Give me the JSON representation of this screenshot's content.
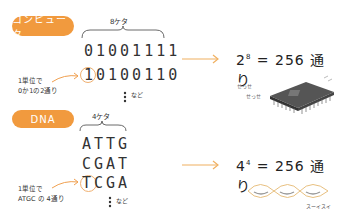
{
  "computer": {
    "tag": "コンピュータ",
    "digits_label": "8ケタ",
    "rows": [
      "01001111",
      "10100110"
    ],
    "etc": "など",
    "note_line1": "1単位で",
    "note_line2": "0か1の2通り",
    "equation_base": "2",
    "equation_exp": "8",
    "equation_result": "= 256 通り",
    "sfx1": "せっせ",
    "sfx2": "せっせ"
  },
  "dna": {
    "tag": "DNA",
    "digits_label": "4ケタ",
    "rows": [
      "ATTG",
      "CGAT",
      "TCGA"
    ],
    "etc": "など",
    "note_line1": "1単位で",
    "note_line2": "ATGC の 4通り",
    "equation_base": "4",
    "equation_exp": "4",
    "equation_result": "= 256 通り",
    "sfx": "スーイスイ"
  },
  "colors": {
    "accent": "#f19a3e",
    "arrow": "#f0b060",
    "text": "#333333"
  }
}
